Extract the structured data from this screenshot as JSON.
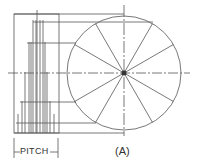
{
  "diagram": {
    "type": "helix-projection-construction",
    "labels": {
      "pitch": "PITCH",
      "figure": "(A)"
    },
    "circle": {
      "center": [
        124,
        73
      ],
      "radius": 57,
      "divisions": 12,
      "division_angle_deg": 30
    },
    "frame": {
      "x1": 14,
      "y1": 14,
      "x2": 59,
      "y2": 133
    },
    "pitch_dimension": {
      "x1": 14,
      "x2": 58,
      "y": 152
    },
    "colors": {
      "line": "#555555",
      "dark": "#333333",
      "background": "#ffffff"
    }
  }
}
